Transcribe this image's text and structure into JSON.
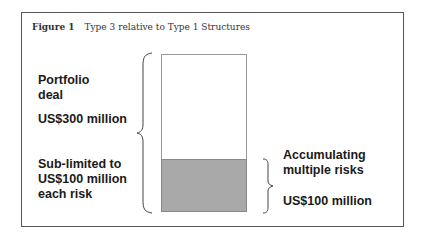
{
  "figure": {
    "label": "Figure 1",
    "title": "Type 3 relative to Type 1 Structures"
  },
  "left_labels": {
    "portfolio_line1": "Portfolio",
    "portfolio_line2": "deal",
    "portfolio_amount": "US$300 million",
    "sublimit_line1": "Sub-limited to",
    "sublimit_line2": "US$100 million",
    "sublimit_line3": "each risk"
  },
  "right_labels": {
    "accum_line1": "Accumulating",
    "accum_line2": "multiple risks",
    "accum_amount": "US$100 million"
  },
  "bar": {
    "total_value": 300,
    "shaded_value": 100,
    "unit": "US$ million",
    "shaded_color": "#a9a9a9",
    "outline_color": "#999999"
  },
  "icons": {
    "left_brace": "brace-left-icon",
    "right_brace": "brace-right-icon"
  }
}
